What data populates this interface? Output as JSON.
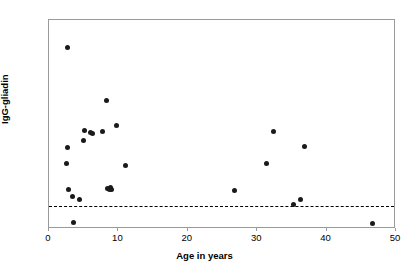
{
  "chart_data": {
    "type": "scatter",
    "title": "",
    "xlabel": "Age in years",
    "ylabel": "IgG-gliadin",
    "xlim": [
      0,
      50
    ],
    "ylim": [
      0,
      180
    ],
    "xticks": [
      0,
      10,
      20,
      30,
      40,
      50
    ],
    "yticks": [
      0,
      20,
      40,
      60,
      80,
      100,
      120,
      140,
      160,
      180
    ],
    "grid": false,
    "legend": null,
    "marker": "filled-circle",
    "marker_color": "#1a1a1a",
    "threshold": {
      "value": 20,
      "style": "dashed",
      "color": "#000000",
      "label": ""
    },
    "series": [
      {
        "name": "IgG-gliadin vs age",
        "points": [
          {
            "x": 2.7,
            "y": 156
          },
          {
            "x": 2.6,
            "y": 70
          },
          {
            "x": 2.5,
            "y": 56
          },
          {
            "x": 2.8,
            "y": 34
          },
          {
            "x": 3.4,
            "y": 28
          },
          {
            "x": 3.5,
            "y": 6
          },
          {
            "x": 4.4,
            "y": 25
          },
          {
            "x": 5.0,
            "y": 76
          },
          {
            "x": 5.1,
            "y": 85
          },
          {
            "x": 6.0,
            "y": 83
          },
          {
            "x": 6.3,
            "y": 82
          },
          {
            "x": 7.7,
            "y": 84
          },
          {
            "x": 8.3,
            "y": 111
          },
          {
            "x": 8.5,
            "y": 35
          },
          {
            "x": 8.7,
            "y": 34
          },
          {
            "x": 8.8,
            "y": 36
          },
          {
            "x": 9.0,
            "y": 34
          },
          {
            "x": 9.7,
            "y": 89
          },
          {
            "x": 11.0,
            "y": 55
          },
          {
            "x": 26.7,
            "y": 33
          },
          {
            "x": 31.3,
            "y": 56
          },
          {
            "x": 32.3,
            "y": 84
          },
          {
            "x": 35.3,
            "y": 21
          },
          {
            "x": 36.2,
            "y": 25
          },
          {
            "x": 36.8,
            "y": 71
          },
          {
            "x": 46.6,
            "y": 5
          }
        ]
      }
    ]
  }
}
